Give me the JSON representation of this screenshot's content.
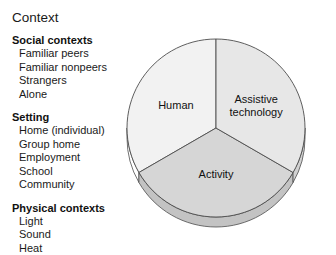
{
  "title": "Context",
  "groups": [
    {
      "heading": "Social contexts",
      "items": [
        "Familiar peers",
        "Familiar nonpeers",
        "Strangers",
        "Alone"
      ]
    },
    {
      "heading": "Setting",
      "items": [
        "Home (individual)",
        "Group home",
        "Employment",
        "School",
        "Community"
      ]
    },
    {
      "heading": "Physical contexts",
      "items": [
        "Light",
        "Sound",
        "Heat"
      ]
    }
  ],
  "chart_data": {
    "type": "pie",
    "title": "",
    "categories": [
      "Human",
      "Activity",
      "Assistive technology"
    ],
    "values": [
      33.33,
      33.33,
      33.33
    ],
    "labels": [
      "Human",
      "Activity",
      "Assistive technology"
    ],
    "colors": [
      "#f2f2f2",
      "#d6d6d6",
      "#e7e7e7"
    ],
    "edge_colors": [
      "#ffffff",
      "#c3c3c3",
      "#d2d2d2"
    ],
    "stroke_color": "#4d4d4d",
    "legend": "none",
    "start_angle_deg": 90,
    "direction": "counterclockwise",
    "three_d": true,
    "label_lines": {
      "Human": [
        "Human"
      ],
      "Activity": [
        "Activity"
      ],
      "Assistive technology": [
        "Assistive",
        "technology"
      ]
    }
  }
}
